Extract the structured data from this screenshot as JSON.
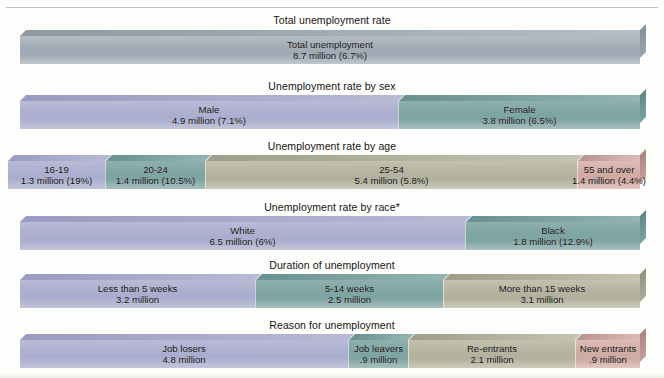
{
  "chart_data": {
    "type": "bar",
    "title": "",
    "orientation": "horizontal-stacked",
    "note": "Stacked 3-D bands; each band totals 8.7 million unemployed",
    "rows": [
      {
        "title": "Total unemployment rate",
        "segments": [
          {
            "label": "Total unemployment",
            "value": "8.7 million (6.7%)",
            "millions": 8.7,
            "rate_pct": 6.7,
            "color": "#adb0cf"
          }
        ]
      },
      {
        "title": "Unemployment rate by sex",
        "segments": [
          {
            "label": "Male",
            "value": "4.9 million (7.1%)",
            "millions": 4.9,
            "rate_pct": 7.1,
            "color": "#adb0cf"
          },
          {
            "label": "Female",
            "value": "3.8 million (6.5%)",
            "millions": 3.8,
            "rate_pct": 6.5,
            "color": "#7fa6a4"
          }
        ]
      },
      {
        "title": "Unemployment rate by age",
        "segments": [
          {
            "label": "16-19",
            "value": "1.3 million (19%)",
            "millions": 1.3,
            "rate_pct": 19.0,
            "color": "#adb0cf"
          },
          {
            "label": "20-24",
            "value": "1.4 million (10.5%)",
            "millions": 1.4,
            "rate_pct": 10.5,
            "color": "#7fa6a4"
          },
          {
            "label": "25-54",
            "value": "5.4 million (5.8%)",
            "millions": 5.4,
            "rate_pct": 5.8,
            "color": "#b5b4a0"
          },
          {
            "label": "55 and over",
            "value": "1.4 million (4.4%)",
            "millions": 1.4,
            "rate_pct": 4.4,
            "color": "#d2ada6"
          }
        ]
      },
      {
        "title": "Unemployment rate by race*",
        "segments": [
          {
            "label": "White",
            "value": "6.5 million (6%)",
            "millions": 6.5,
            "rate_pct": 6.0,
            "color": "#adb0cf"
          },
          {
            "label": "Black",
            "value": "1.8 million (12.9%)",
            "millions": 1.8,
            "rate_pct": 12.9,
            "color": "#7fa6a4"
          }
        ]
      },
      {
        "title": "Duration of unemployment",
        "segments": [
          {
            "label": "Less than 5 weeks",
            "value": "3.2 million",
            "millions": 3.2,
            "color": "#adb0cf"
          },
          {
            "label": "5-14 weeks",
            "value": "2.5 million",
            "millions": 2.5,
            "color": "#7fa6a4"
          },
          {
            "label": "More than 15 weeks",
            "value": "3.1 million",
            "millions": 3.1,
            "color": "#b5b4a0"
          }
        ]
      },
      {
        "title": "Reason for unemployment",
        "segments": [
          {
            "label": "Job losers",
            "value": "4.8 million",
            "millions": 4.8,
            "color": "#adb0cf"
          },
          {
            "label": "Job leavers",
            "value": ".9 million",
            "millions": 0.9,
            "color": "#7fa6a4"
          },
          {
            "label": "Re-entrants",
            "value": "2.1 million",
            "millions": 2.1,
            "color": "#b5b4a0"
          },
          {
            "label": "New entrants",
            "value": ".9 million",
            "millions": 0.9,
            "color": "#d2ada6"
          }
        ]
      }
    ]
  },
  "layout": {
    "rows": [
      {
        "title_top": 14,
        "bar_top": 30,
        "left": 20,
        "right": 646,
        "segs": [
          {
            "x": 20,
            "w": 620,
            "cls": "c-greyteal",
            "last": true
          }
        ]
      },
      {
        "title_top": 80,
        "bar_top": 95,
        "left": 20,
        "right": 646,
        "segs": [
          {
            "x": 20,
            "w": 378,
            "cls": "c-purple"
          },
          {
            "x": 398,
            "w": 242,
            "cls": "c-teal",
            "last": true
          }
        ]
      },
      {
        "title_top": 140,
        "bar_top": 155,
        "left": 8,
        "right": 646,
        "segs": [
          {
            "x": 8,
            "w": 97,
            "cls": "c-purple"
          },
          {
            "x": 105,
            "w": 100,
            "cls": "c-teal"
          },
          {
            "x": 205,
            "w": 372,
            "cls": "c-olive"
          },
          {
            "x": 577,
            "w": 63,
            "cls": "c-pink",
            "last": true,
            "overflow": true
          }
        ]
      },
      {
        "title_top": 201,
        "bar_top": 216,
        "left": 20,
        "right": 646,
        "segs": [
          {
            "x": 20,
            "w": 445,
            "cls": "c-purple"
          },
          {
            "x": 465,
            "w": 175,
            "cls": "c-teal",
            "last": true
          }
        ]
      },
      {
        "title_top": 259,
        "bar_top": 274,
        "left": 20,
        "right": 646,
        "segs": [
          {
            "x": 20,
            "w": 235,
            "cls": "c-purple"
          },
          {
            "x": 255,
            "w": 188,
            "cls": "c-teal"
          },
          {
            "x": 443,
            "w": 197,
            "cls": "c-olive",
            "last": true
          }
        ]
      },
      {
        "title_top": 319,
        "bar_top": 334,
        "left": 20,
        "right": 646,
        "segs": [
          {
            "x": 20,
            "w": 328,
            "cls": "c-purple"
          },
          {
            "x": 348,
            "w": 60,
            "cls": "c-teal"
          },
          {
            "x": 408,
            "w": 167,
            "cls": "c-olive"
          },
          {
            "x": 575,
            "w": 65,
            "cls": "c-pink",
            "last": true
          }
        ]
      }
    ]
  }
}
